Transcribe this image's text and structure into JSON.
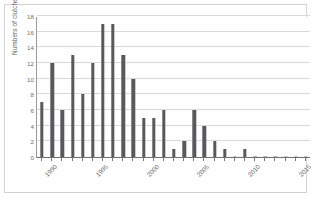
{
  "chart_data": {
    "type": "bar",
    "title": "",
    "xlabel": "",
    "ylabel": "Numbers of clutches",
    "ylim": [
      0,
      18
    ],
    "ytick_step": 2,
    "yticks": [
      0,
      2,
      4,
      6,
      8,
      10,
      12,
      14,
      16,
      18
    ],
    "grid": true,
    "legend": false,
    "bar_color": "#59595b",
    "gridline_color": "#d9d9d9",
    "axis_color": "#6f6f6f",
    "categories": [
      "1990",
      "1991",
      "1992",
      "1993",
      "1994",
      "1995",
      "1996",
      "1997",
      "1998",
      "1999",
      "2000",
      "2001",
      "2002",
      "2003",
      "2004",
      "2005",
      "2006",
      "2007",
      "2008",
      "2009",
      "2010",
      "2011",
      "2012",
      "2013",
      "2014",
      "2015",
      "2016"
    ],
    "values": [
      7,
      12,
      6,
      13,
      8,
      12,
      17,
      17,
      13,
      10,
      5,
      5,
      6,
      1,
      2,
      6,
      4,
      2,
      1,
      0,
      1,
      0,
      0,
      0,
      0,
      0,
      0
    ],
    "xtick_labels": [
      "1990",
      "1995",
      "2000",
      "2005",
      "2010",
      "2015"
    ],
    "xtick_categories": [
      "1990",
      "1995",
      "2000",
      "2005",
      "2010",
      "2015"
    ]
  },
  "axis": {
    "y_title": "Numbers of clutches",
    "y_labels": [
      "18",
      "16",
      "14",
      "12",
      "10",
      "8",
      "6",
      "4",
      "2",
      "0"
    ],
    "x_labels": [
      "1990",
      "1995",
      "2000",
      "2005",
      "2010",
      "2015"
    ]
  }
}
